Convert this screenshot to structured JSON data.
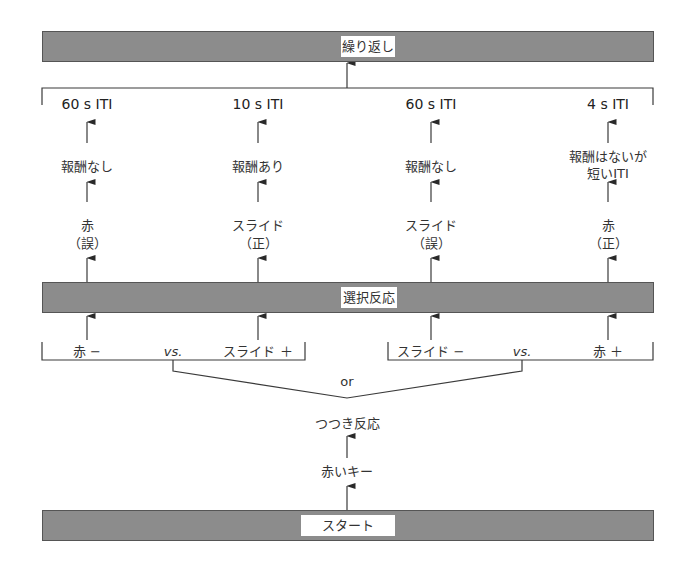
{
  "bars": {
    "top": "繰り返し",
    "middle": "選択反応",
    "bottom": "スタート"
  },
  "columns": [
    {
      "iti": "60 s ITI",
      "reward": [
        "報酬なし"
      ],
      "choice": [
        "赤",
        "（誤）"
      ]
    },
    {
      "iti": "10 s ITI",
      "reward": [
        "報酬あり"
      ],
      "choice": [
        "スライド",
        "（正）"
      ]
    },
    {
      "iti": "60 s ITI",
      "reward": [
        "報酬なし"
      ],
      "choice": [
        "スライド",
        "（誤）"
      ]
    },
    {
      "iti": "4 s ITI",
      "reward": [
        "報酬はないが",
        "短いITI"
      ],
      "choice": [
        "赤",
        "（正）"
      ]
    }
  ],
  "conditions": {
    "left": {
      "a": "赤 −",
      "vs": "vs.",
      "b": "スライド ＋"
    },
    "right": {
      "a": "スライド −",
      "vs": "vs.",
      "b": "赤 ＋"
    },
    "joiner": "or"
  },
  "steps": {
    "peck": "つつき反応",
    "red_key": "赤いキー"
  },
  "colors": {
    "bar_fill": "#8c8c8c",
    "line": "#3a3a3a"
  }
}
